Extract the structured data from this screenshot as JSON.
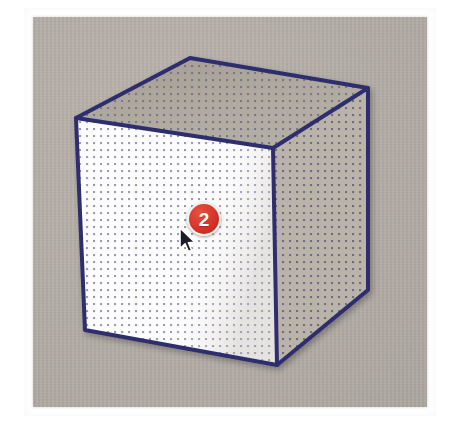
{
  "screenshot": {
    "width": 452,
    "height": 429,
    "background_color": "#ffffff",
    "description": "Photographed tutorial illustration of a wireframe cube on a gray paper panel, with a red step marker and a mouse pointer on the front face."
  },
  "panel": {
    "name": "drawing-canvas",
    "background_color": "#b3aca5",
    "border_color": "#ffffff",
    "x": 33,
    "y": 17,
    "width": 394,
    "height": 390
  },
  "cube": {
    "name": "cube-illustration",
    "outline_color": "#2e2e6e",
    "outline_width": 4,
    "dot_color": "#6a6a8c",
    "faces": [
      {
        "id": "top-face",
        "label": "Top face",
        "fill_color": "#b0a99f",
        "points": "190,58 368,88 273,148 76,118"
      },
      {
        "id": "front-face",
        "label": "Front face",
        "fill_color": "#fdfdfd",
        "points": "76,118 273,148 277,365 85,330"
      },
      {
        "id": "right-face",
        "label": "Right face",
        "fill_color": "#c2bbb2",
        "points": "273,148 368,88 368,290 277,365"
      }
    ],
    "vertices": {
      "top_apex": [
        190,
        58
      ],
      "top_right": [
        368,
        88
      ],
      "top_front": [
        273,
        148
      ],
      "top_left": [
        76,
        118
      ],
      "bottom_left": [
        85,
        330
      ],
      "bottom_front": [
        277,
        365
      ],
      "bottom_right": [
        368,
        290
      ]
    }
  },
  "step_badge": {
    "name": "step-marker",
    "number": "2",
    "fill_color": "#d6342a",
    "ring_color": "#f2f0ec",
    "text_color": "#ffffff",
    "x": 187,
    "y": 202,
    "diameter": 34
  },
  "cursor": {
    "name": "mouse-pointer",
    "type": "arrow",
    "fill_color": "#1c1c28",
    "outline_color": "#ffffff",
    "x": 178,
    "y": 227
  }
}
